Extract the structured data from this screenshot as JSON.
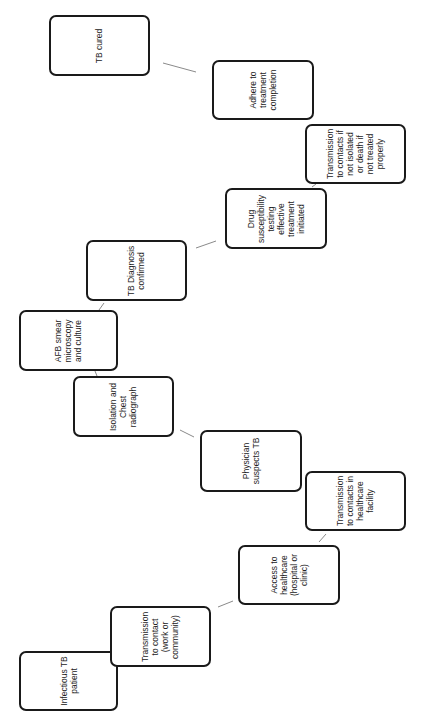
{
  "diagram": {
    "type": "flowchart",
    "orientation": "rotated-90-ccw",
    "colors": {
      "background": "#ffffff",
      "border": "#1a1a1a",
      "connector": "#8a8a8a",
      "text": "#222222"
    },
    "nodes": [
      {
        "id": "infectious",
        "label": "Infectious TB\npatient",
        "x": 19,
        "y": 651,
        "w": 99,
        "h": 60
      },
      {
        "id": "transmission_contact",
        "label": "Transmission\nto contact\n(work or\ncommunity)",
        "x": 110,
        "y": 606,
        "w": 101,
        "h": 61
      },
      {
        "id": "access",
        "label": "Access to\nhealthcare\n(hospital or\nclinic)",
        "x": 238,
        "y": 545,
        "w": 102,
        "h": 60
      },
      {
        "id": "transmission_healthcare",
        "label": "Transmission\nto contacts in\nhealthcare\nfacility",
        "x": 305,
        "y": 471,
        "w": 101,
        "h": 60
      },
      {
        "id": "physician",
        "label": "Physician\nsuspects TB",
        "x": 200,
        "y": 430,
        "w": 102,
        "h": 62
      },
      {
        "id": "isolation",
        "label": "Isolation and\nChest\nradiograph",
        "x": 73,
        "y": 376,
        "w": 101,
        "h": 61
      },
      {
        "id": "afb",
        "label": "AFB smear\nmicroscopy\nand culture",
        "x": 19,
        "y": 310,
        "w": 99,
        "h": 61
      },
      {
        "id": "diagnosis",
        "label": "TB Diagnosis\nconfirmed",
        "x": 86,
        "y": 240,
        "w": 101,
        "h": 61
      },
      {
        "id": "drug",
        "label": "Drug\nsusceptibility\ntesting\neffective\ntreatment\ninitiated",
        "x": 225,
        "y": 188,
        "w": 102,
        "h": 61
      },
      {
        "id": "transmission_isolated",
        "label": "Transmission\nto contacts if\nnot isolated\nor death if\nnot treated\nproperly",
        "x": 305,
        "y": 124,
        "w": 101,
        "h": 60
      },
      {
        "id": "adhere",
        "label": "Adhere to\ntreatment\ncompletion",
        "x": 212,
        "y": 60,
        "w": 102,
        "h": 60
      },
      {
        "id": "cured",
        "label": "TB cured",
        "x": 49,
        "y": 15,
        "w": 101,
        "h": 61
      }
    ],
    "edges": [
      {
        "from": "transmission_contact",
        "to": "access",
        "x1": 218,
        "y1": 607,
        "x2": 233,
        "y2": 601
      },
      {
        "from": "access",
        "to": "transmission_healthcare",
        "x1": 319,
        "y1": 542,
        "x2": 326,
        "y2": 534
      },
      {
        "from": "isolation",
        "to": "physician",
        "x1": 180,
        "y1": 430,
        "x2": 194,
        "y2": 437
      },
      {
        "from": "afb",
        "to": "isolation",
        "x1": 95,
        "y1": 371,
        "x2": 97,
        "y2": 376
      },
      {
        "from": "afb",
        "to": "diagnosis",
        "x1": 99,
        "y1": 310,
        "x2": 104,
        "y2": 303
      },
      {
        "from": "diagnosis",
        "to": "drug",
        "x1": 196,
        "y1": 248,
        "x2": 216,
        "y2": 241
      },
      {
        "from": "drug",
        "to": "transmission_isolated",
        "x1": 312,
        "y1": 187,
        "x2": 316,
        "y2": 184
      },
      {
        "from": "adhere",
        "to": "cured",
        "x1": 196,
        "y1": 72,
        "x2": 163,
        "y2": 63
      }
    ]
  }
}
